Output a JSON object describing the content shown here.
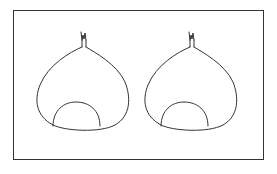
{
  "figure": {
    "stroke_color": "#333333",
    "background_color": "#ffffff",
    "items": [
      {
        "name": "chestnut-left",
        "offset_x": 0
      },
      {
        "name": "chestnut-right",
        "offset_x": 108
      }
    ]
  }
}
